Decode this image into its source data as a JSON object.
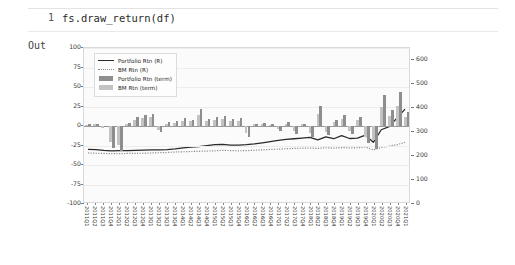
{
  "notebook": {
    "prompt_number": "1",
    "code": "fs.draw_return(df)",
    "output_label": "Out"
  },
  "chart_data": {
    "type": "bar",
    "title": "",
    "xlabel": "",
    "ylabel": "",
    "grid": true,
    "legend_position": "upper-left",
    "left_axis": {
      "name": "Rtn (R)",
      "ticks": [
        "100",
        "75",
        "50",
        "25",
        "0",
        "-25",
        "-50",
        "-75",
        "-100"
      ],
      "ylim": [
        -100,
        100
      ]
    },
    "right_axis": {
      "name": "Rtn (term)",
      "ticks": [
        "0",
        "100",
        "200",
        "300",
        "400",
        "500",
        "600"
      ],
      "ylim": [
        0,
        650
      ]
    },
    "categories": [
      "2011Q1",
      "2011Q2",
      "2011Q3",
      "2011Q4",
      "2012Q1",
      "2012Q2",
      "2012Q3",
      "2012Q4",
      "2013Q1",
      "2013Q2",
      "2013Q3",
      "2013Q4",
      "2014Q1",
      "2014Q2",
      "2014Q3",
      "2014Q4",
      "2015Q1",
      "2015Q2",
      "2015Q3",
      "2015Q4",
      "2016Q1",
      "2016Q2",
      "2016Q3",
      "2016Q4",
      "2017Q1",
      "2017Q2",
      "2017Q3",
      "2017Q4",
      "2018Q1",
      "2018Q2",
      "2018Q3",
      "2018Q4",
      "2019Q1",
      "2019Q2",
      "2019Q3",
      "2019Q4",
      "2020Q1",
      "2020Q2",
      "2020Q3",
      "2020Q4",
      "2021Q1"
    ],
    "series": [
      {
        "name": "Portfolio Rtn (R)",
        "type": "line",
        "style": "solid",
        "color": "#2a2a2a",
        "axis": "right",
        "values": [
          -78,
          -79,
          -82,
          -84,
          -83,
          -83,
          -82,
          -81,
          -80,
          -80,
          -79,
          -76,
          -72,
          -68,
          -66,
          -62,
          -58,
          -57,
          -60,
          -60,
          -58,
          -55,
          -50,
          -45,
          -40,
          -36,
          -33,
          -30,
          -27,
          -38,
          -25,
          -33,
          -20,
          -32,
          -30,
          -18,
          -48,
          5,
          18,
          55,
          92
        ]
      },
      {
        "name": "BM Rtn (R)",
        "type": "line",
        "style": "dotted",
        "color": "#8a8a8a",
        "axis": "right",
        "values": [
          -93,
          -94,
          -95,
          -96,
          -96,
          -95,
          -95,
          -94,
          -93,
          -92,
          -91,
          -89,
          -88,
          -87,
          -86,
          -85,
          -84,
          -82,
          -83,
          -84,
          -83,
          -82,
          -80,
          -78,
          -77,
          -75,
          -74,
          -73,
          -72,
          -74,
          -71,
          -73,
          -70,
          -72,
          -71,
          -68,
          -80,
          -70,
          -64,
          -58,
          -48
        ]
      },
      {
        "name": "Portfolio Rtn (term)",
        "type": "bar",
        "color": "#8e8e8e",
        "axis": "left",
        "values": [
          2,
          3,
          -1,
          -28,
          -32,
          4,
          12,
          14,
          16,
          -8,
          5,
          6,
          10,
          8,
          22,
          9,
          11,
          13,
          9,
          10,
          -14,
          3,
          4,
          2,
          -6,
          5,
          -10,
          3,
          -14,
          26,
          -12,
          8,
          14,
          -10,
          12,
          -22,
          -30,
          40,
          20,
          44,
          18
        ]
      },
      {
        "name": "BM Rtn (term)",
        "type": "bar",
        "color": "#c3c3c3",
        "axis": "left",
        "values": [
          1,
          2,
          -2,
          -20,
          -24,
          3,
          8,
          10,
          12,
          -5,
          3,
          4,
          6,
          6,
          14,
          7,
          8,
          9,
          6,
          7,
          -9,
          2,
          3,
          1,
          -4,
          3,
          -7,
          2,
          -9,
          16,
          -8,
          5,
          9,
          -7,
          8,
          -14,
          -18,
          24,
          13,
          26,
          11
        ]
      }
    ]
  }
}
